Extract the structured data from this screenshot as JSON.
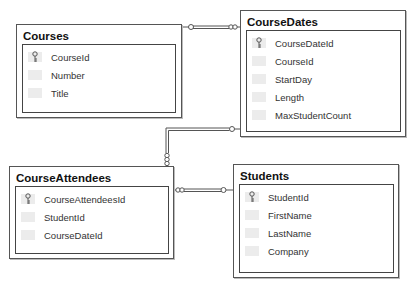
{
  "diagram": {
    "tables": [
      {
        "name": "Courses",
        "columns": [
          {
            "name": "CourseId",
            "primary_key": true
          },
          {
            "name": "Number",
            "primary_key": false
          },
          {
            "name": "Title",
            "primary_key": false
          }
        ]
      },
      {
        "name": "CourseDates",
        "columns": [
          {
            "name": "CourseDateId",
            "primary_key": true
          },
          {
            "name": "CourseId",
            "primary_key": false
          },
          {
            "name": "StartDay",
            "primary_key": false
          },
          {
            "name": "Length",
            "primary_key": false
          },
          {
            "name": "MaxStudentCount",
            "primary_key": false
          }
        ]
      },
      {
        "name": "CourseAttendees",
        "columns": [
          {
            "name": "CourseAttendeesId",
            "primary_key": true
          },
          {
            "name": "StudentId",
            "primary_key": false
          },
          {
            "name": "CourseDateId",
            "primary_key": false
          }
        ]
      },
      {
        "name": "Students",
        "columns": [
          {
            "name": "StudentId",
            "primary_key": true
          },
          {
            "name": "FirstName",
            "primary_key": false
          },
          {
            "name": "LastName",
            "primary_key": false
          },
          {
            "name": "Company",
            "primary_key": false
          }
        ]
      }
    ],
    "relationships": [
      {
        "from": "Courses",
        "to": "CourseDates",
        "from_end": "one (key)",
        "to_end": "many (infinity)"
      },
      {
        "from": "CourseDates",
        "to": "CourseAttendees",
        "from_end": "one (key)",
        "to_end": "many (infinity)"
      },
      {
        "from": "Students",
        "to": "CourseAttendees",
        "from_end": "one (key)",
        "to_end": "many (infinity)"
      }
    ]
  }
}
